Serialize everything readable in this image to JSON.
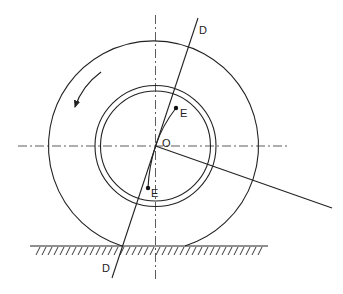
{
  "diagram": {
    "type": "wheel-rolling-on-ground",
    "colors": {
      "stroke": "#222222",
      "background": "#ffffff"
    },
    "labels": {
      "axis_top": "D",
      "axis_bottom": "D",
      "center": "O",
      "point_upper": "E",
      "point_lower": "E"
    },
    "geometry": {
      "center": [
        155.5,
        146
      ],
      "outer_tire_radius": 105,
      "rim_outer_radius": 61,
      "rim_inner_radius": 55,
      "ground_y": 246,
      "contact_patch_x": [
        122,
        185
      ],
      "axis_D": {
        "from": [
          198,
          18
        ],
        "to": [
          112,
          278
        ]
      },
      "radial_line_end": [
        332,
        208
      ],
      "point_upper_E": [
        176,
        108
      ],
      "point_lower_E": [
        148,
        188
      ]
    },
    "rotation_arrow": "counter-clockwise"
  }
}
